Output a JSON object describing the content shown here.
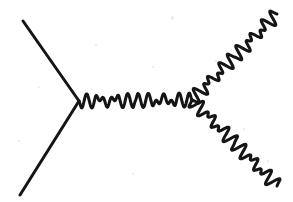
{
  "canvas": {
    "width": 293,
    "height": 202,
    "background_color": "#ffffff",
    "stroke_color": "#151515",
    "stroke_width": 3
  },
  "diagram": {
    "type": "feynman-diagram",
    "vertices": [
      {
        "name": "left-vertex",
        "x": 79,
        "y": 101
      },
      {
        "name": "right-vertex",
        "x": 192,
        "y": 100
      }
    ],
    "lines": [
      {
        "name": "incoming-fermion-upper-left",
        "style": "straight",
        "from": {
          "x": 23,
          "y": 21
        },
        "to": {
          "x": 79,
          "y": 101
        }
      },
      {
        "name": "incoming-fermion-lower-left",
        "style": "straight",
        "from": {
          "x": 79,
          "y": 101
        },
        "to": {
          "x": 20,
          "y": 195
        }
      },
      {
        "name": "internal-boson-propagator",
        "style": "wavy",
        "from": {
          "x": 79,
          "y": 101
        },
        "to": {
          "x": 192,
          "y": 100
        },
        "oscillations": 11,
        "amplitude": 7
      },
      {
        "name": "outgoing-boson-upper-right",
        "style": "wavy",
        "from": {
          "x": 192,
          "y": 100
        },
        "to": {
          "x": 277,
          "y": 14
        },
        "oscillations": 10,
        "amplitude": 7
      },
      {
        "name": "outgoing-boson-lower-right",
        "style": "wavy",
        "from": {
          "x": 192,
          "y": 100
        },
        "to": {
          "x": 277,
          "y": 186
        },
        "oscillations": 10,
        "amplitude": 7
      }
    ]
  }
}
